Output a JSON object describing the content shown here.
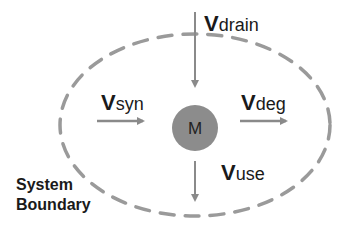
{
  "diagram": {
    "node": {
      "label": "M",
      "fill": "#8c8c8c"
    },
    "boundary": {
      "line1": "System",
      "line2": "Boundary",
      "stroke": "#9a9a9a"
    },
    "arrow_color": "#8a8a8a",
    "fluxes": {
      "drain": {
        "symbol": "V",
        "subscript": "drain"
      },
      "syn": {
        "symbol": "V",
        "subscript": "syn"
      },
      "deg": {
        "symbol": "V",
        "subscript": "deg"
      },
      "use": {
        "symbol": "V",
        "subscript": "use"
      }
    }
  }
}
